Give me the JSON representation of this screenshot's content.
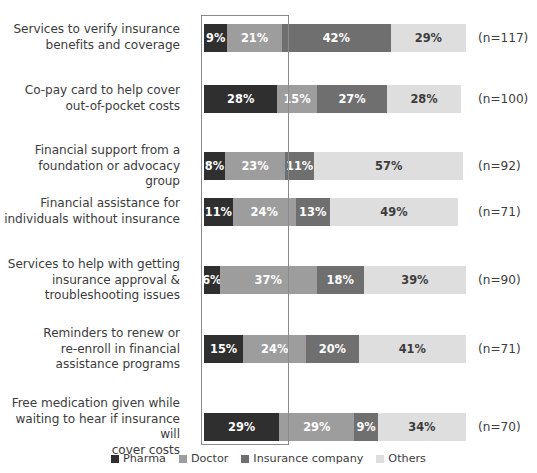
{
  "chart_data": {
    "type": "bar",
    "subtype": "stacked-horizontal-100pct",
    "title": "",
    "xlabel": "",
    "ylabel": "",
    "xlim": [
      0,
      100
    ],
    "grid": false,
    "legend_position": "bottom-center",
    "series": [
      {
        "name": "Pharma",
        "color": "#2f2f2f",
        "values": [
          9,
          28,
          8,
          11,
          6,
          15,
          29
        ]
      },
      {
        "name": "Doctor",
        "color": "#9d9d9d",
        "values": [
          21,
          15,
          23,
          24,
          37,
          24,
          29
        ]
      },
      {
        "name": "Insurance company",
        "color": "#6f6f6f",
        "values": [
          42,
          27,
          11,
          13,
          18,
          20,
          9
        ]
      },
      {
        "name": "Others",
        "color": "#dedede",
        "values": [
          29,
          28,
          57,
          49,
          39,
          41,
          34
        ]
      }
    ],
    "categories": [
      "Services to verify insurance\nbenefits and coverage",
      "Co-pay card to help cover\nout-of-pocket costs",
      "Financial support from a\nfoundation or advocacy group",
      "Financial assistance for\nindividuals without insurance",
      "Services to help with getting\ninsurance approval &\ntroubleshooting issues",
      "Reminders to renew or\nre-enroll in financial\nassistance programs",
      "Free medication given while\nwaiting to hear if insurance will\ncover costs"
    ],
    "sample_sizes": [
      "(n=117)",
      "(n=100)",
      "(n=92)",
      "(n=71)",
      "(n=90)",
      "(n=71)",
      "(n=70)"
    ],
    "value_labels": [
      [
        "9%",
        "21%",
        "42%",
        "29%"
      ],
      [
        "28%",
        "15%",
        "27%",
        "28%"
      ],
      [
        "8%",
        "23%",
        "11%",
        "57%"
      ],
      [
        "11%",
        "24%",
        "13%",
        "49%"
      ],
      [
        "6%",
        "37%",
        "18%",
        "39%"
      ],
      [
        "15%",
        "24%",
        "20%",
        "41%"
      ],
      [
        "29%",
        "29%",
        "9%",
        "34%"
      ]
    ],
    "annotations": [
      {
        "type": "rectangle-outline",
        "name": "highlight-box",
        "color": "#8a8a8a"
      }
    ]
  },
  "legend": {
    "items": [
      {
        "label": "Pharma",
        "color": "#2f2f2f"
      },
      {
        "label": "Doctor",
        "color": "#9d9d9d"
      },
      {
        "label": "Insurance company",
        "color": "#6f6f6f"
      },
      {
        "label": "Others",
        "color": "#dedede"
      }
    ]
  }
}
